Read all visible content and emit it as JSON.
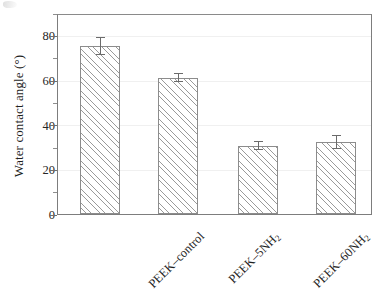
{
  "chart_data": {
    "type": "bar",
    "title": "",
    "subtitle": "",
    "xlabel": "",
    "ylabel": "Water contact angle (°)",
    "categories": [
      "PEEK–control",
      "PEEK–5NH2",
      "PEEK–60NH2",
      "PEEK–180NH2"
    ],
    "category_labels_html": [
      "PEEK–control",
      "PEEK–5NH<sub>2</sub>",
      "PEEK–60NH<sub>2</sub>",
      "PEEK–180NH<sub>2</sub>"
    ],
    "values": [
      75,
      60.5,
      30,
      32
    ],
    "errors": [
      4,
      1,
      1,
      3
    ],
    "ylim": [
      0,
      90
    ],
    "ytick_labels": [
      "0",
      "20",
      "40",
      "60",
      "80"
    ],
    "ytick_values": [
      0,
      20,
      40,
      60,
      80
    ],
    "yminor_tick_values": [
      10,
      30,
      50,
      70,
      90
    ],
    "grid": "horizontal-faint",
    "legend": "none",
    "bar_fill": "diagonal-hatch",
    "bar_edge_color": "#8c8c8c",
    "axis_color": "#7d7d7d",
    "text_color": "#1f1f1f",
    "xlabel_rotation_deg": -45
  }
}
